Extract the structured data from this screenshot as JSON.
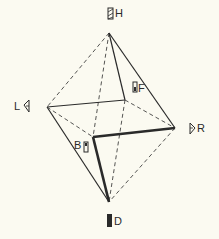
{
  "diagram": {
    "type": "octahedron",
    "colors": {
      "background": "#fbfaf1",
      "line": "#2a2a2a"
    },
    "vertices": [
      {
        "id": "H",
        "label": "H",
        "x": 109,
        "y": 33
      },
      {
        "id": "L",
        "label": "L",
        "x": 47,
        "y": 107
      },
      {
        "id": "F",
        "label": "F",
        "x": 125,
        "y": 100
      },
      {
        "id": "R",
        "label": "R",
        "x": 175,
        "y": 128
      },
      {
        "id": "B",
        "label": "B",
        "x": 93,
        "y": 137
      },
      {
        "id": "D",
        "label": "D",
        "x": 109,
        "y": 202
      }
    ],
    "edges": {
      "solid": [
        "H-F",
        "H-R",
        "L-F",
        "L-D"
      ],
      "thick": [
        "B-R",
        "B-D"
      ],
      "dashed": [
        "H-L",
        "H-B",
        "F-D",
        "F-R",
        "L-B",
        "R-D"
      ]
    },
    "icons": {
      "H": "hatched-block-icon",
      "L": "left-triangle-icon",
      "F": "front-block-icon",
      "R": "right-triangle-icon",
      "B": "back-block-icon",
      "D": "solid-block-icon"
    }
  }
}
